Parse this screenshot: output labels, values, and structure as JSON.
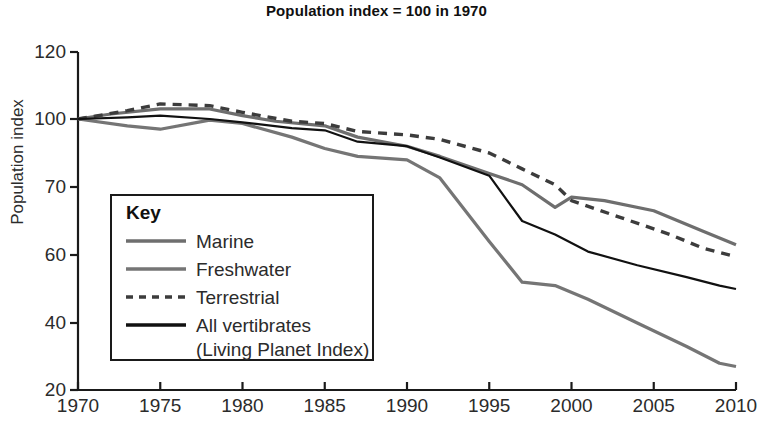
{
  "chart_data": {
    "type": "line",
    "title": "Population index = 100 in 1970",
    "xlabel": "",
    "ylabel": "Population index",
    "grid": false,
    "legend_position": "inside-left",
    "legend_title": "Key",
    "xlim": [
      1970,
      2010
    ],
    "x_ticks": [
      1970,
      1975,
      1980,
      1985,
      1990,
      1995,
      2000,
      2005,
      2010
    ],
    "y_ticks": [
      120,
      100,
      70,
      60,
      40,
      20
    ],
    "y_axis_note": "Tick marks are evenly spaced in pixels although the labelled values are not evenly spaced (120, 100, 70, 60, 40, 20).",
    "series": [
      {
        "name": "Marine",
        "color": "#6e6e6e",
        "style": "solid",
        "x": [
          1970,
          1972,
          1975,
          1978,
          1980,
          1982,
          1985,
          1987,
          1990,
          1992,
          1995,
          1997,
          1999,
          2000,
          2002,
          2005,
          2008,
          2010
        ],
        "values": [
          100,
          101.5,
          103,
          103,
          101,
          99,
          97,
          92,
          88,
          83.5,
          76,
          71,
          67,
          68.5,
          68,
          66.5,
          63.5,
          61.5
        ]
      },
      {
        "name": "Freshwater",
        "color": "#757575",
        "style": "solid",
        "x": [
          1970,
          1973,
          1975,
          1978,
          1980,
          1983,
          1985,
          1987,
          1990,
          1992,
          1995,
          1997,
          1999,
          2001,
          2004,
          2007,
          2009,
          2010
        ],
        "values": [
          100,
          97,
          95.5,
          99.5,
          98,
          92,
          87,
          83.5,
          82,
          74,
          62,
          52,
          51,
          47,
          40,
          33,
          28,
          27
        ]
      },
      {
        "name": "Terrestrial",
        "color": "#3c3c3c",
        "style": "dashed",
        "x": [
          1970,
          1973,
          1975,
          1978,
          1980,
          1983,
          1985,
          1987,
          1990,
          1992,
          1995,
          1997,
          1999,
          2000,
          2003,
          2006,
          2008,
          2010
        ],
        "values": [
          100,
          102.5,
          104.5,
          104,
          102,
          99,
          98,
          94.5,
          93,
          91,
          85,
          78,
          71,
          68,
          65.5,
          63,
          61,
          59.5
        ]
      },
      {
        "name": "All vertibrates (Living Planet Index)",
        "color": "#111111",
        "style": "solid",
        "x": [
          1970,
          1973,
          1975,
          1978,
          1980,
          1983,
          1985,
          1987,
          1990,
          1992,
          1995,
          1997,
          1999,
          2001,
          2004,
          2007,
          2009,
          2010
        ],
        "values": [
          100,
          100.5,
          101,
          100,
          98.5,
          96,
          95,
          90,
          88,
          83,
          75,
          65,
          63,
          60.5,
          57,
          53.5,
          51,
          50
        ]
      }
    ]
  },
  "axes": {
    "y_tick_labels": [
      "120",
      "100",
      "70",
      "60",
      "40",
      "20"
    ],
    "x_tick_labels": [
      "1970",
      "1975",
      "1980",
      "1985",
      "1990",
      "1995",
      "2000",
      "2005",
      "2010"
    ]
  },
  "legend": {
    "title": "Key",
    "items": [
      {
        "label": "Marine",
        "style": "solid",
        "color": "#6e6e6e"
      },
      {
        "label": "Freshwater",
        "style": "solid",
        "color": "#757575"
      },
      {
        "label": "Terrestrial",
        "style": "dashed",
        "color": "#3c3c3c"
      },
      {
        "label": "All vertibrates",
        "style": "solid",
        "color": "#111111"
      }
    ],
    "item_sublabel": "(Living Planet Index)"
  }
}
